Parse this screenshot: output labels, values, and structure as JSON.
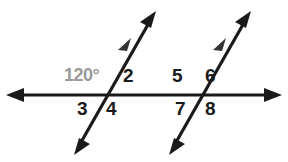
{
  "figure": {
    "background_color": "#ffffff",
    "line_color": "#1a1a1a",
    "measure_color": "#999999"
  },
  "labels": {
    "angle_measure": "120°",
    "a2": "2",
    "a3": "3",
    "a4": "4",
    "a5": "5",
    "a6": "6",
    "a7": "7",
    "a8": "8"
  },
  "geometry": {
    "transversal_line": {
      "name": "horizontal-transversal",
      "x1": 8,
      "y1": 95,
      "x2": 280,
      "y2": 95,
      "arrows": "both"
    },
    "parallel_lines": [
      {
        "name": "parallel-line-left",
        "x1": 78,
        "y1": 148,
        "x2": 155,
        "y2": 13,
        "arrows": "both",
        "tick_arrow": true
      },
      {
        "name": "parallel-line-right",
        "x1": 173,
        "y1": 148,
        "x2": 250,
        "y2": 13,
        "arrows": "both",
        "tick_arrow": true
      }
    ],
    "intersections": [
      {
        "name": "intersection-left",
        "x": 108,
        "y": 95
      },
      {
        "name": "intersection-right",
        "x": 203,
        "y": 95
      }
    ]
  }
}
